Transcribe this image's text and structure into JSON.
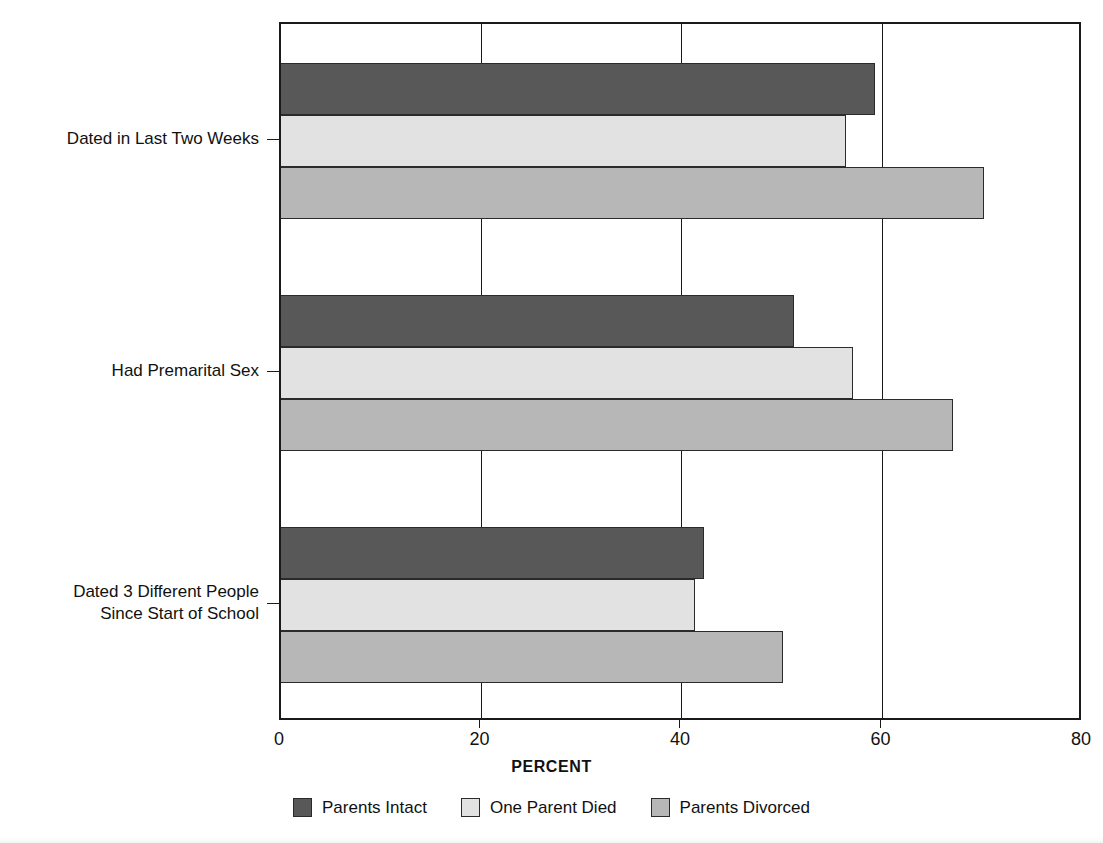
{
  "chart_data": {
    "type": "bar",
    "orientation": "horizontal",
    "title": "",
    "xlabel": "PERCENT",
    "ylabel": "",
    "xlim": [
      0,
      80
    ],
    "xticks": [
      0,
      20,
      40,
      60,
      80
    ],
    "xticklabels": [
      "0",
      "20",
      "40",
      "60",
      "80"
    ],
    "grid": "vertical",
    "legend_position": "bottom",
    "categories": [
      "Dated in Last Two Weeks",
      "Had Premarital Sex",
      "Dated 3 Different People\nSince Start of School"
    ],
    "category_lines": [
      [
        "Dated in Last Two Weeks"
      ],
      [
        "Had Premarital Sex"
      ],
      [
        "Dated 3 Different People",
        "Since Start of School"
      ]
    ],
    "series": [
      {
        "name": "Parents Intact",
        "color": "#585858",
        "values": [
          59.3,
          51.2,
          42.2
        ]
      },
      {
        "name": "One Parent Died",
        "color": "#e2e2e2",
        "values": [
          56.4,
          57.1,
          41.3
        ]
      },
      {
        "name": "Parents Divorced",
        "color": "#b7b7b7",
        "values": [
          70.1,
          67.0,
          50.1
        ]
      }
    ]
  },
  "legend": {
    "items": [
      {
        "label": "Parents Intact",
        "swatch": "swatch-parents-intact"
      },
      {
        "label": "One Parent Died",
        "swatch": "swatch-one-parent-died"
      },
      {
        "label": "Parents Divorced",
        "swatch": "swatch-parents-divorced"
      }
    ]
  },
  "axis": {
    "x_title": "PERCENT",
    "x_tick_labels": [
      "0",
      "20",
      "40",
      "60",
      "80"
    ]
  }
}
